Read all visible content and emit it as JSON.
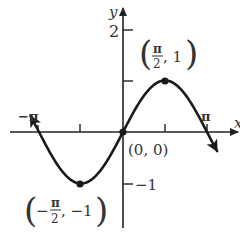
{
  "chart_data": {
    "type": "line",
    "title": "",
    "function": "y = sin x",
    "xlabel": "x",
    "ylabel": "y",
    "x_ticks": [
      {
        "value": -3.14159,
        "label": "−π"
      },
      {
        "value": -1.5708,
        "label": ""
      },
      {
        "value": 1.5708,
        "label": ""
      },
      {
        "value": 3.14159,
        "label": "π"
      }
    ],
    "y_ticks": [
      {
        "value": 2,
        "label": "2"
      },
      {
        "value": 1,
        "label": ""
      },
      {
        "value": -1,
        "label": "−1"
      }
    ],
    "xlim": [
      -3.5,
      3.9
    ],
    "ylim": [
      -1.9,
      2.4
    ],
    "grid": false,
    "legend": null,
    "series": [
      {
        "name": "sin x",
        "x": [
          -3.14159,
          -2.35619,
          -1.5708,
          -0.7854,
          0,
          0.7854,
          1.5708,
          2.35619,
          3.14159
        ],
        "values": [
          0,
          -0.7071,
          -1,
          -0.7071,
          0,
          0.7071,
          1,
          0.7071,
          0
        ]
      }
    ],
    "highlighted_points": [
      {
        "x": 1.5708,
        "y": 1,
        "label": "(π/2, 1)"
      },
      {
        "x": 0,
        "y": 0,
        "label": "(0, 0)"
      },
      {
        "x": -1.5708,
        "y": -1,
        "label": "(−π/2, −1)"
      }
    ],
    "annotations": {
      "max_label": {
        "num": "π",
        "den": "2",
        "rest": ", 1"
      },
      "origin_label": "(0, 0)",
      "min_label": {
        "sign": "−",
        "num": "π",
        "den": "2",
        "rest": ", −1"
      }
    }
  }
}
